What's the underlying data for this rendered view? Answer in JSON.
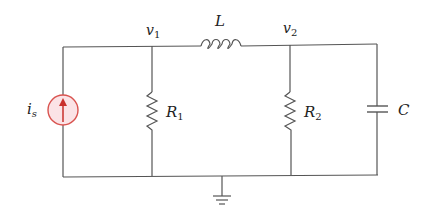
{
  "circuit": {
    "nodes": {
      "v1": {
        "label": "v",
        "sub": "1"
      },
      "v2": {
        "label": "v",
        "sub": "2"
      }
    },
    "components": {
      "source": {
        "label": "i",
        "sub": "s",
        "type": "current-source",
        "color": "#d9534f",
        "fill": "#fbe3e6"
      },
      "R1": {
        "label": "R",
        "sub": "1",
        "type": "resistor"
      },
      "R2": {
        "label": "R",
        "sub": "2",
        "type": "resistor"
      },
      "L": {
        "label": "L",
        "type": "inductor"
      },
      "C": {
        "label": "C",
        "type": "capacitor"
      }
    },
    "ground": {
      "type": "ground"
    }
  }
}
